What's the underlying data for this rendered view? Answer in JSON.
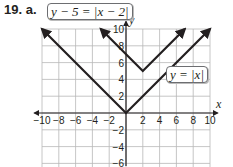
{
  "problem": {
    "label": "19. a."
  },
  "equations": {
    "shifted": "y − 5 = |x − 2|",
    "parent": "y = |x|"
  },
  "axes": {
    "x_label": "x",
    "y_label": "y",
    "x_ticks": [
      "−10",
      "−8",
      "−6",
      "−4",
      "−2",
      "2",
      "4",
      "6",
      "8",
      "10"
    ],
    "y_ticks": [
      "10",
      "8",
      "6",
      "4",
      "2",
      "−2",
      "−4",
      "−6"
    ]
  },
  "chart_data": {
    "type": "line",
    "title": "",
    "xlabel": "x",
    "ylabel": "y",
    "xlim": [
      -10,
      10
    ],
    "ylim": [
      -6,
      10
    ],
    "grid": true,
    "grid_step": 2,
    "series": [
      {
        "name": "y = |x|",
        "points": [
          [
            -10,
            10
          ],
          [
            0,
            0
          ],
          [
            10,
            10
          ]
        ],
        "arrows": "both ends"
      },
      {
        "name": "y − 5 = |x − 2|",
        "points": [
          [
            -3,
            10
          ],
          [
            2,
            5
          ],
          [
            7,
            10
          ]
        ],
        "arrows": "both ends"
      }
    ],
    "annotations": [
      {
        "text": "y − 5 = |x − 2|",
        "position": "top-left, boxed"
      },
      {
        "text": "y = |x|",
        "position": "right of y-axis near y=4, boxed"
      }
    ]
  }
}
